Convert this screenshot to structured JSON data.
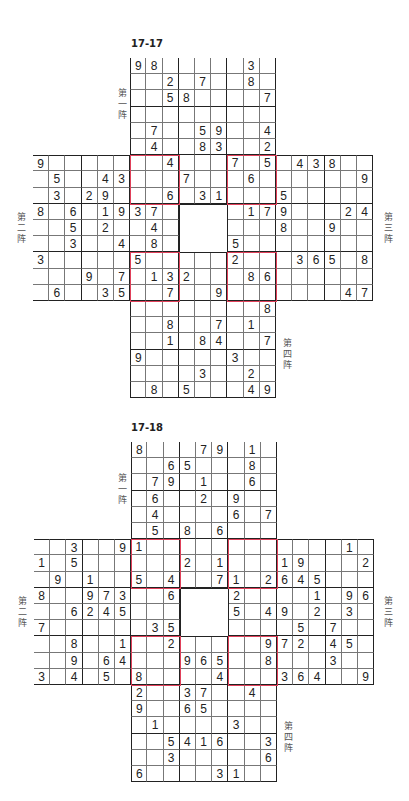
{
  "colors": {
    "grid_line": "#777777",
    "box_line": "#222222",
    "overlap_box": "#e0405a",
    "digit": "#222222"
  },
  "puzzles": [
    {
      "title": "17-17",
      "origin": {
        "x": 33,
        "y": 58
      },
      "cell_size": 16.2,
      "labels": {
        "grid1": "第一阵",
        "grid2": "第二阵",
        "grid3": "第三阵",
        "grid4": "第四阵"
      },
      "label_positions": {
        "grid1": {
          "x": 117,
          "y": 88
        },
        "grid2": {
          "x": 16,
          "y": 212
        },
        "grid3": {
          "x": 383,
          "y": 212
        },
        "grid4": {
          "x": 282,
          "y": 338
        }
      },
      "givens": [
        [
          0,
          6,
          9
        ],
        [
          0,
          7,
          8
        ],
        [
          0,
          13,
          3
        ],
        [
          1,
          8,
          2
        ],
        [
          1,
          10,
          7
        ],
        [
          1,
          13,
          8
        ],
        [
          2,
          8,
          5
        ],
        [
          2,
          9,
          8
        ],
        [
          2,
          14,
          7
        ],
        [
          4,
          7,
          7
        ],
        [
          4,
          10,
          5
        ],
        [
          4,
          11,
          9
        ],
        [
          4,
          14,
          4
        ],
        [
          5,
          7,
          4
        ],
        [
          5,
          10,
          8
        ],
        [
          5,
          11,
          3
        ],
        [
          5,
          14,
          2
        ],
        [
          6,
          0,
          9
        ],
        [
          6,
          8,
          4
        ],
        [
          6,
          12,
          7
        ],
        [
          6,
          14,
          5
        ],
        [
          6,
          16,
          4
        ],
        [
          6,
          17,
          3
        ],
        [
          6,
          18,
          8
        ],
        [
          7,
          1,
          5
        ],
        [
          7,
          4,
          4
        ],
        [
          7,
          5,
          3
        ],
        [
          7,
          9,
          7
        ],
        [
          7,
          13,
          6
        ],
        [
          7,
          20,
          9
        ],
        [
          8,
          1,
          3
        ],
        [
          8,
          3,
          2
        ],
        [
          8,
          4,
          9
        ],
        [
          8,
          8,
          6
        ],
        [
          8,
          10,
          3
        ],
        [
          8,
          11,
          1
        ],
        [
          8,
          15,
          5
        ],
        [
          9,
          0,
          8
        ],
        [
          9,
          2,
          6
        ],
        [
          9,
          4,
          1
        ],
        [
          9,
          5,
          9
        ],
        [
          9,
          6,
          3
        ],
        [
          9,
          7,
          7
        ],
        [
          9,
          13,
          1
        ],
        [
          9,
          14,
          7
        ],
        [
          9,
          15,
          9
        ],
        [
          9,
          19,
          2
        ],
        [
          9,
          20,
          4
        ],
        [
          10,
          2,
          5
        ],
        [
          10,
          4,
          2
        ],
        [
          10,
          7,
          4
        ],
        [
          10,
          15,
          8
        ],
        [
          10,
          18,
          9
        ],
        [
          11,
          2,
          3
        ],
        [
          11,
          5,
          4
        ],
        [
          11,
          7,
          8
        ],
        [
          11,
          12,
          5
        ],
        [
          12,
          0,
          3
        ],
        [
          12,
          6,
          5
        ],
        [
          12,
          12,
          2
        ],
        [
          12,
          16,
          3
        ],
        [
          12,
          17,
          6
        ],
        [
          12,
          18,
          5
        ],
        [
          12,
          20,
          8
        ],
        [
          13,
          3,
          9
        ],
        [
          13,
          5,
          7
        ],
        [
          13,
          7,
          1
        ],
        [
          13,
          8,
          3
        ],
        [
          13,
          9,
          2
        ],
        [
          13,
          13,
          8
        ],
        [
          13,
          14,
          6
        ],
        [
          14,
          1,
          6
        ],
        [
          14,
          4,
          3
        ],
        [
          14,
          5,
          5
        ],
        [
          14,
          8,
          7
        ],
        [
          14,
          11,
          9
        ],
        [
          14,
          19,
          4
        ],
        [
          14,
          20,
          7
        ],
        [
          15,
          14,
          8
        ],
        [
          16,
          8,
          8
        ],
        [
          16,
          11,
          7
        ],
        [
          16,
          13,
          1
        ],
        [
          17,
          8,
          1
        ],
        [
          17,
          10,
          8
        ],
        [
          17,
          11,
          4
        ],
        [
          17,
          14,
          7
        ],
        [
          18,
          6,
          9
        ],
        [
          18,
          12,
          3
        ],
        [
          19,
          10,
          3
        ],
        [
          19,
          13,
          2
        ],
        [
          20,
          7,
          8
        ],
        [
          20,
          9,
          5
        ],
        [
          20,
          13,
          4
        ],
        [
          20,
          14,
          9
        ]
      ]
    },
    {
      "title": "17-18",
      "origin": {
        "x": 34,
        "y": 442
      },
      "cell_size": 16.2,
      "labels": {
        "grid1": "第一阵",
        "grid2": "第二阵",
        "grid3": "第三阵",
        "grid4": "第四阵"
      },
      "label_positions": {
        "grid1": {
          "x": 117,
          "y": 473
        },
        "grid2": {
          "x": 17,
          "y": 596
        },
        "grid3": {
          "x": 383,
          "y": 596
        },
        "grid4": {
          "x": 283,
          "y": 721
        }
      },
      "givens": [
        [
          0,
          6,
          8
        ],
        [
          0,
          10,
          7
        ],
        [
          0,
          11,
          9
        ],
        [
          0,
          13,
          1
        ],
        [
          1,
          8,
          6
        ],
        [
          1,
          9,
          5
        ],
        [
          1,
          13,
          8
        ],
        [
          2,
          7,
          7
        ],
        [
          2,
          8,
          9
        ],
        [
          2,
          10,
          1
        ],
        [
          2,
          13,
          6
        ],
        [
          3,
          7,
          6
        ],
        [
          3,
          10,
          2
        ],
        [
          3,
          12,
          9
        ],
        [
          4,
          7,
          4
        ],
        [
          4,
          12,
          6
        ],
        [
          4,
          14,
          7
        ],
        [
          5,
          7,
          5
        ],
        [
          5,
          9,
          8
        ],
        [
          5,
          11,
          6
        ],
        [
          6,
          2,
          3
        ],
        [
          6,
          5,
          9
        ],
        [
          6,
          6,
          1
        ],
        [
          6,
          19,
          1
        ],
        [
          7,
          0,
          1
        ],
        [
          7,
          2,
          5
        ],
        [
          7,
          9,
          2
        ],
        [
          7,
          11,
          1
        ],
        [
          7,
          15,
          1
        ],
        [
          7,
          16,
          9
        ],
        [
          7,
          20,
          2
        ],
        [
          8,
          1,
          9
        ],
        [
          8,
          3,
          1
        ],
        [
          8,
          6,
          5
        ],
        [
          8,
          8,
          4
        ],
        [
          8,
          11,
          7
        ],
        [
          8,
          12,
          1
        ],
        [
          8,
          14,
          2
        ],
        [
          8,
          15,
          6
        ],
        [
          8,
          16,
          4
        ],
        [
          8,
          17,
          5
        ],
        [
          9,
          0,
          8
        ],
        [
          9,
          3,
          9
        ],
        [
          9,
          4,
          7
        ],
        [
          9,
          5,
          3
        ],
        [
          9,
          8,
          6
        ],
        [
          9,
          12,
          2
        ],
        [
          9,
          17,
          1
        ],
        [
          9,
          19,
          9
        ],
        [
          9,
          20,
          6
        ],
        [
          10,
          2,
          6
        ],
        [
          10,
          3,
          2
        ],
        [
          10,
          4,
          4
        ],
        [
          10,
          5,
          5
        ],
        [
          10,
          12,
          5
        ],
        [
          10,
          14,
          4
        ],
        [
          10,
          15,
          9
        ],
        [
          10,
          17,
          2
        ],
        [
          10,
          19,
          3
        ],
        [
          11,
          0,
          7
        ],
        [
          11,
          7,
          3
        ],
        [
          11,
          8,
          5
        ],
        [
          11,
          16,
          5
        ],
        [
          11,
          18,
          7
        ],
        [
          12,
          2,
          8
        ],
        [
          12,
          5,
          1
        ],
        [
          12,
          8,
          2
        ],
        [
          12,
          14,
          9
        ],
        [
          12,
          15,
          7
        ],
        [
          12,
          16,
          2
        ],
        [
          12,
          18,
          4
        ],
        [
          12,
          19,
          5
        ],
        [
          13,
          2,
          9
        ],
        [
          13,
          4,
          6
        ],
        [
          13,
          5,
          4
        ],
        [
          13,
          9,
          9
        ],
        [
          13,
          10,
          6
        ],
        [
          13,
          11,
          5
        ],
        [
          13,
          14,
          8
        ],
        [
          13,
          18,
          3
        ],
        [
          14,
          0,
          3
        ],
        [
          14,
          2,
          4
        ],
        [
          14,
          4,
          5
        ],
        [
          14,
          6,
          8
        ],
        [
          14,
          11,
          4
        ],
        [
          14,
          15,
          3
        ],
        [
          14,
          16,
          6
        ],
        [
          14,
          17,
          4
        ],
        [
          14,
          20,
          9
        ],
        [
          15,
          6,
          2
        ],
        [
          15,
          9,
          3
        ],
        [
          15,
          10,
          7
        ],
        [
          15,
          13,
          4
        ],
        [
          16,
          6,
          9
        ],
        [
          16,
          9,
          6
        ],
        [
          16,
          10,
          5
        ],
        [
          17,
          7,
          1
        ],
        [
          17,
          12,
          3
        ],
        [
          18,
          8,
          5
        ],
        [
          18,
          9,
          4
        ],
        [
          18,
          10,
          1
        ],
        [
          18,
          11,
          6
        ],
        [
          18,
          14,
          3
        ],
        [
          19,
          8,
          3
        ],
        [
          19,
          14,
          6
        ],
        [
          20,
          6,
          6
        ],
        [
          20,
          11,
          3
        ],
        [
          20,
          12,
          1
        ]
      ]
    }
  ]
}
